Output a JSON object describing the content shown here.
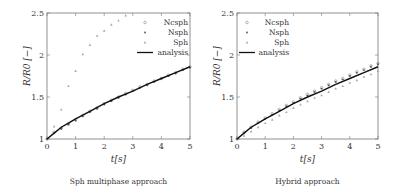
{
  "chart_data": [
    {
      "type": "scatter",
      "title": "",
      "caption": "Sph multiphase approach",
      "xlabel": "t[s]",
      "ylabel": "R/R0 [−]",
      "xlim": [
        0,
        5
      ],
      "ylim": [
        1,
        2.5
      ],
      "xticks": [
        "0",
        "1",
        "2",
        "3",
        "4",
        "5"
      ],
      "yticks": [
        "1",
        "1.5",
        "2",
        "2.5"
      ],
      "grid": false,
      "legend_position": "top-right",
      "series": [
        {
          "name": "Ncsph",
          "marker": "circle",
          "color": "#888888",
          "x": [
            0,
            0.25,
            0.5,
            0.75,
            1,
            1.25,
            1.5,
            1.75,
            2,
            2.25,
            2.5,
            2.75,
            3,
            3.25,
            3.5,
            3.75,
            4,
            4.25,
            4.5,
            4.75,
            5
          ],
          "y": [
            1.0,
            1.08,
            1.13,
            1.18,
            1.23,
            1.28,
            1.33,
            1.37,
            1.42,
            1.46,
            1.5,
            1.54,
            1.58,
            1.62,
            1.65,
            1.69,
            1.72,
            1.76,
            1.79,
            1.83,
            1.86
          ]
        },
        {
          "name": "Nsph",
          "marker": "star",
          "color": "#555555",
          "x": [
            0,
            0.25,
            0.5,
            0.75,
            1,
            1.25,
            1.5,
            1.75,
            2,
            2.25,
            2.5,
            2.75,
            3,
            3.25,
            3.5,
            3.75,
            4,
            4.25,
            4.5,
            4.75,
            5
          ],
          "y": [
            1.0,
            1.07,
            1.12,
            1.17,
            1.22,
            1.27,
            1.32,
            1.36,
            1.41,
            1.45,
            1.49,
            1.53,
            1.57,
            1.61,
            1.64,
            1.68,
            1.72,
            1.75,
            1.78,
            1.82,
            1.85
          ]
        },
        {
          "name": "Sph",
          "marker": "triangle",
          "color": "#aaaaaa",
          "x": [
            0.25,
            0.5,
            0.75,
            1,
            1.25,
            1.5,
            1.75,
            2,
            2.25,
            2.5,
            2.75
          ],
          "y": [
            1.15,
            1.35,
            1.63,
            1.81,
            2.01,
            2.12,
            2.23,
            2.29,
            2.36,
            2.41,
            2.47
          ]
        },
        {
          "name": "analysis",
          "marker": "line",
          "color": "#111111",
          "x": [
            0,
            0.25,
            0.5,
            0.75,
            1,
            1.5,
            2,
            2.5,
            3,
            3.5,
            4,
            4.5,
            5
          ],
          "y": [
            1.0,
            1.07,
            1.14,
            1.19,
            1.24,
            1.33,
            1.42,
            1.5,
            1.57,
            1.65,
            1.72,
            1.79,
            1.86
          ]
        }
      ]
    },
    {
      "type": "scatter",
      "title": "",
      "caption": "Hybrid approach",
      "xlabel": "t[s]",
      "ylabel": "R/R0 [−]",
      "xlim": [
        0,
        5
      ],
      "ylim": [
        1,
        2.5
      ],
      "xticks": [
        "0",
        "1",
        "2",
        "3",
        "4",
        "5"
      ],
      "yticks": [
        "1",
        "1.5",
        "2",
        "2.5"
      ],
      "grid": false,
      "legend_position": "top-left",
      "series": [
        {
          "name": "Ncsph",
          "marker": "circle",
          "color": "#888888",
          "x": [
            0,
            0.25,
            0.5,
            0.75,
            1,
            1.25,
            1.5,
            1.75,
            2,
            2.25,
            2.5,
            2.75,
            3,
            3.25,
            3.5,
            3.75,
            4,
            4.25,
            4.5,
            4.75,
            5
          ],
          "y": [
            1.0,
            1.08,
            1.14,
            1.2,
            1.25,
            1.3,
            1.35,
            1.4,
            1.44,
            1.49,
            1.53,
            1.57,
            1.61,
            1.65,
            1.69,
            1.72,
            1.76,
            1.8,
            1.83,
            1.87,
            1.9
          ]
        },
        {
          "name": "Nsph",
          "marker": "star",
          "color": "#555555",
          "x": [
            0,
            0.25,
            0.5,
            0.75,
            1,
            1.25,
            1.5,
            1.75,
            2,
            2.25,
            2.5,
            2.75,
            3,
            3.25,
            3.5,
            3.75,
            4,
            4.25,
            4.5,
            4.75,
            5
          ],
          "y": [
            1.0,
            1.07,
            1.13,
            1.19,
            1.24,
            1.29,
            1.34,
            1.39,
            1.43,
            1.48,
            1.52,
            1.56,
            1.6,
            1.64,
            1.68,
            1.71,
            1.75,
            1.79,
            1.82,
            1.86,
            1.89
          ]
        },
        {
          "name": "Sph",
          "marker": "triangle",
          "color": "#aaaaaa",
          "x": [
            0.25,
            0.5,
            0.75,
            1,
            1.25,
            1.5,
            1.75,
            2,
            2.25,
            2.5,
            2.75,
            3,
            3.25,
            3.5,
            3.75,
            4,
            4.25,
            4.5,
            4.75,
            5
          ],
          "y": [
            1.04,
            1.09,
            1.14,
            1.19,
            1.23,
            1.28,
            1.32,
            1.37,
            1.41,
            1.45,
            1.49,
            1.52,
            1.56,
            1.6,
            1.63,
            1.67,
            1.7,
            1.74,
            1.77,
            1.81
          ]
        },
        {
          "name": "analysis",
          "marker": "line",
          "color": "#111111",
          "x": [
            0,
            0.25,
            0.5,
            0.75,
            1,
            1.5,
            2,
            2.5,
            3,
            3.5,
            4,
            4.5,
            5
          ],
          "y": [
            1.0,
            1.07,
            1.14,
            1.19,
            1.24,
            1.33,
            1.42,
            1.5,
            1.57,
            1.65,
            1.72,
            1.79,
            1.86
          ]
        }
      ]
    }
  ]
}
